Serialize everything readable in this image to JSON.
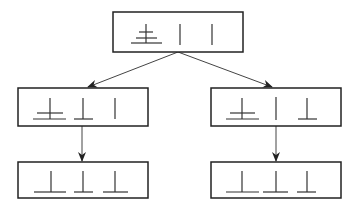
{
  "diagram": {
    "title": "",
    "colors": {
      "stroke": "#222222",
      "background": "#ffffff"
    },
    "nodes": [
      {
        "id": "root",
        "x": 113,
        "y": 12,
        "w": 130,
        "h": 40,
        "symbols": [
          "cross-with-base",
          "vertical-line",
          "vertical-line"
        ]
      },
      {
        "id": "left-mid",
        "x": 18,
        "y": 88,
        "w": 130,
        "h": 38,
        "symbols": [
          "cross-with-base",
          "up-tack",
          "vertical-line"
        ]
      },
      {
        "id": "right-mid",
        "x": 211,
        "y": 88,
        "w": 130,
        "h": 38,
        "symbols": [
          "cross-with-base",
          "vertical-line",
          "up-tack"
        ]
      },
      {
        "id": "left-bottom",
        "x": 18,
        "y": 162,
        "w": 130,
        "h": 36,
        "symbols": [
          "up-tack",
          "up-tack",
          "up-tack"
        ]
      },
      {
        "id": "right-bottom",
        "x": 211,
        "y": 162,
        "w": 130,
        "h": 36,
        "symbols": [
          "up-tack",
          "up-tack",
          "up-tack"
        ]
      }
    ],
    "edges": [
      {
        "from": "root",
        "to": "left-mid"
      },
      {
        "from": "root",
        "to": "right-mid"
      },
      {
        "from": "left-mid",
        "to": "left-bottom"
      },
      {
        "from": "right-mid",
        "to": "right-bottom"
      }
    ]
  }
}
